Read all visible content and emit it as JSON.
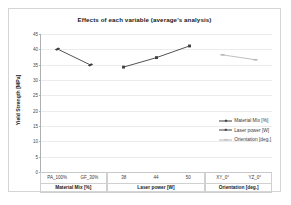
{
  "figure": {
    "title": "Effects of each variable (average's analysis)"
  },
  "chart_data": {
    "type": "line",
    "title": "Effects of each variable (average's analysis)",
    "xlabel": "",
    "ylabel": "Yield Strength [MPa]",
    "ylim": [
      0,
      45
    ],
    "yticks": [
      0,
      5,
      10,
      15,
      20,
      25,
      30,
      35,
      40,
      45
    ],
    "ytick_labels": [
      "0",
      "5",
      "10",
      "15",
      "20",
      "25",
      "30",
      "35",
      "40",
      "45"
    ],
    "grid": true,
    "legend_position": "center-right",
    "categories": [
      "PA_100%",
      "GF_30%",
      "38",
      "44",
      "50",
      "XY_0°",
      "YZ_0°"
    ],
    "category_groups": [
      {
        "name": "Material Mix [%]",
        "ticks": [
          "PA_100%",
          "GF_30%"
        ]
      },
      {
        "name": "Laser power [W]",
        "ticks": [
          "38",
          "44",
          "50"
        ]
      },
      {
        "name": "Orientation [deg.]",
        "ticks": [
          "XY_0°",
          "YZ_0°"
        ]
      }
    ],
    "series": [
      {
        "name": "Material Mix [%]",
        "color": "#404040",
        "marker": "diamond",
        "x": [
          "PA_100%",
          "GF_30%"
        ],
        "values": [
          40.1,
          34.9
        ]
      },
      {
        "name": "Laser power [W]",
        "color": "#404040",
        "marker": "square",
        "x": [
          "38",
          "44",
          "50"
        ],
        "values": [
          34.2,
          37.3,
          41.1
        ]
      },
      {
        "name": "Orientation [deg.]",
        "color": "#b8b8b8",
        "marker": "dash",
        "x": [
          "XY_0°",
          "YZ_0°"
        ],
        "values": [
          38.2,
          36.6
        ]
      }
    ]
  },
  "legend": {
    "entries": [
      {
        "label": "Material Mix [%]"
      },
      {
        "label": "Laser power [W]"
      },
      {
        "label": "Orientation [deg.]"
      }
    ]
  }
}
